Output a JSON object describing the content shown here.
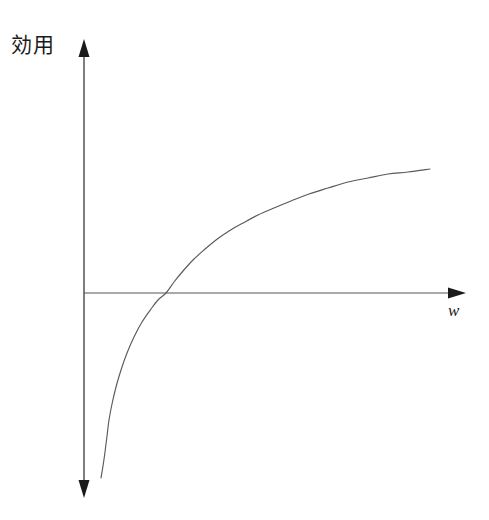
{
  "figure": {
    "background_color": "#ffffff",
    "width": 489,
    "height": 520,
    "line_color": "#555555",
    "curve_color": "#5a5a5a",
    "axis_color": "#333333"
  },
  "labels": {
    "y_axis": "効用",
    "x_axis": "w"
  },
  "chart_data": {
    "type": "line",
    "title": "",
    "subtitle": "",
    "xlabel": "w",
    "ylabel": "効用",
    "grid": false,
    "legend": null,
    "annotations": [],
    "axes": {
      "x_axis_pixel_y": 293,
      "y_axis_pixel_x": 84,
      "x_axis_start_pixel_x": 84,
      "x_axis_arrow_tip_pixel_x": 465,
      "y_axis_top_arrow_tip_pixel_y": 40,
      "y_axis_bottom_arrow_tip_pixel_y": 497,
      "x_tick_labels": [],
      "y_tick_labels": [],
      "origin_label": "",
      "double_headed_y_axis": true
    },
    "zero_crossing": {
      "x": 166,
      "y": 0
    },
    "points_pixel": [
      [
        101,
        478
      ],
      [
        103,
        466
      ],
      [
        105,
        452
      ],
      [
        107,
        436
      ],
      [
        109,
        420
      ],
      [
        112,
        404
      ],
      [
        116,
        387
      ],
      [
        121,
        370
      ],
      [
        127,
        353
      ],
      [
        134,
        337
      ],
      [
        142,
        322
      ],
      [
        151,
        309
      ],
      [
        158,
        300
      ],
      [
        166,
        293
      ],
      [
        174,
        282
      ],
      [
        183,
        271
      ],
      [
        193,
        260
      ],
      [
        204,
        250
      ],
      [
        216,
        240
      ],
      [
        229,
        231
      ],
      [
        243,
        223
      ],
      [
        258,
        215
      ],
      [
        274,
        208
      ],
      [
        291,
        201
      ],
      [
        309,
        194
      ],
      [
        328,
        188
      ],
      [
        348,
        182
      ],
      [
        368,
        178
      ],
      [
        388,
        174
      ],
      [
        408,
        172
      ],
      [
        430,
        169
      ]
    ],
    "x": [
      0.02,
      0.05,
      0.09,
      0.14,
      0.2,
      0.27,
      0.35,
      0.44,
      0.55,
      0.67,
      0.8,
      0.95,
      1.0,
      1.2,
      1.4,
      1.7,
      2.0,
      2.4,
      2.8,
      3.3,
      3.9,
      4.5,
      5.2,
      6.0,
      6.9,
      7.9,
      9.0,
      10.2,
      11.5,
      12.9,
      14.5
    ],
    "y": [
      -3.9,
      -3.0,
      -2.4,
      -1.95,
      -1.6,
      -1.3,
      -1.05,
      -0.82,
      -0.6,
      -0.4,
      -0.22,
      -0.05,
      0.0,
      0.18,
      0.34,
      0.53,
      0.69,
      0.88,
      1.03,
      1.19,
      1.36,
      1.5,
      1.65,
      1.79,
      1.93,
      2.07,
      2.2,
      2.32,
      2.44,
      2.56,
      2.67
    ],
    "xlim": [
      0,
      16
    ],
    "ylim": [
      -4.2,
      3.2
    ]
  }
}
